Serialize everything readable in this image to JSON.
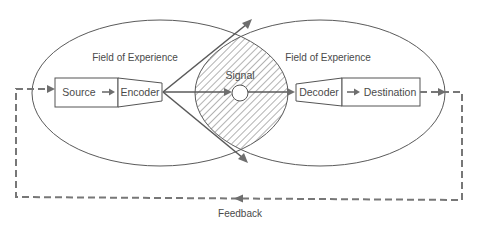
{
  "diagram": {
    "fields": [
      {
        "label": "Field of Experience",
        "side": "sender"
      },
      {
        "label": "Field of Experience",
        "side": "receiver"
      }
    ],
    "nodes": {
      "source": "Source",
      "encoder": "Encoder",
      "signal": "Signal",
      "decoder": "Decoder",
      "destination": "Destination"
    },
    "feedback_label": "Feedback",
    "edges": [
      {
        "from": "Source",
        "to": "Encoder",
        "style": "solid"
      },
      {
        "from": "Encoder",
        "to": "Signal",
        "style": "solid"
      },
      {
        "from": "Signal",
        "to": "Decoder",
        "style": "solid"
      },
      {
        "from": "Decoder",
        "to": "Destination",
        "style": "solid"
      },
      {
        "from": "Destination",
        "to": "Source",
        "style": "dashed",
        "label": "Feedback"
      }
    ],
    "colors": {
      "line": "#5a5a5a",
      "arrow": "#6e6e6e",
      "text": "#4a4a4a",
      "background": "#ffffff"
    }
  }
}
